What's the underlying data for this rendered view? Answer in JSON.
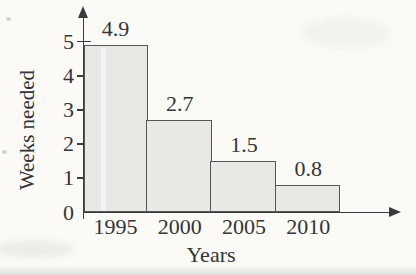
{
  "chart_data": {
    "type": "bar",
    "title": "",
    "xlabel": "Years",
    "ylabel": "Weeks needed",
    "categories": [
      "1995",
      "2000",
      "2005",
      "2010"
    ],
    "values": [
      4.9,
      2.7,
      1.5,
      0.8
    ],
    "value_labels": [
      "4.9",
      "2.7",
      "1.5",
      "0.8"
    ],
    "yticks": [
      0,
      1,
      2,
      3,
      4,
      5
    ],
    "ylim": [
      0,
      5
    ],
    "grid": false,
    "legend": "none",
    "bar_fill": "#e9e8e4",
    "bar_border": "#56565a",
    "axis_color": "#3b3b3d",
    "text_color": "#343436",
    "paper_color": "#fbfaf7"
  }
}
